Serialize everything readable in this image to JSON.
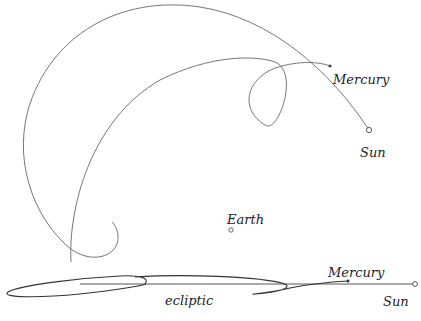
{
  "diagram": {
    "type": "orbital-path",
    "top_view": {
      "labels": {
        "mercury": "Mercury",
        "sun": "Sun",
        "earth": "Earth"
      }
    },
    "side_view": {
      "labels": {
        "mercury": "Mercury",
        "sun": "Sun",
        "ecliptic": "ecliptic"
      }
    },
    "colors": {
      "stroke": "#666666",
      "text": "#222222",
      "background": "#ffffff"
    }
  }
}
